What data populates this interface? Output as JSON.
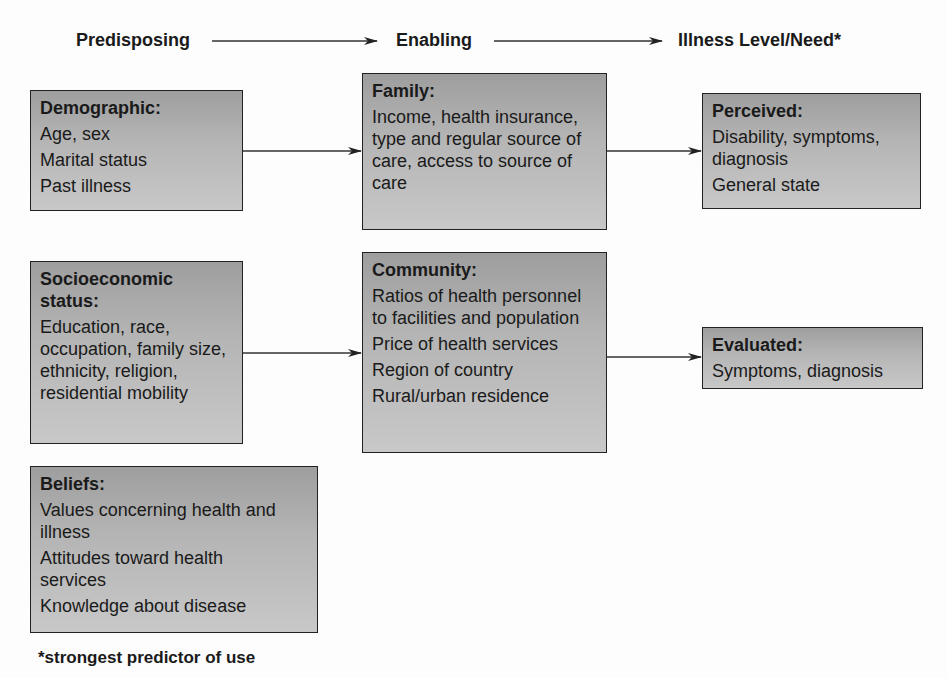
{
  "headers": {
    "predisposing": "Predisposing",
    "enabling": "Enabling",
    "need": "Illness Level/Need*"
  },
  "boxes": {
    "demographic": {
      "title": "Demographic:",
      "items": [
        "Age, sex",
        "Marital status",
        "Past illness"
      ]
    },
    "socioeconomic": {
      "title": "Socioeconomic status:",
      "items": [
        "Education, race, occupation, family size, ethnicity, religion, residential mobility"
      ]
    },
    "beliefs": {
      "title": "Beliefs:",
      "items": [
        "Values concerning health and illness",
        "Attitudes toward health services",
        "Knowledge about disease"
      ]
    },
    "family": {
      "title": "Family:",
      "items": [
        "Income, health insurance, type and regular source of care, access to source of care"
      ]
    },
    "community": {
      "title": "Community:",
      "items": [
        "Ratios of health personnel to facilities and population",
        "Price of health services",
        "Region of country",
        "Rural/urban residence"
      ]
    },
    "perceived": {
      "title": "Perceived:",
      "items": [
        "Disability, symptoms, diagnosis",
        "General state"
      ]
    },
    "evaluated": {
      "title": "Evaluated:",
      "items": [
        "Symptoms, diagnosis"
      ]
    }
  },
  "footnote": "*strongest predictor of use",
  "colors": {
    "box_fill": "#b0b0b0",
    "border": "#222222",
    "text": "#1a1a1a"
  }
}
